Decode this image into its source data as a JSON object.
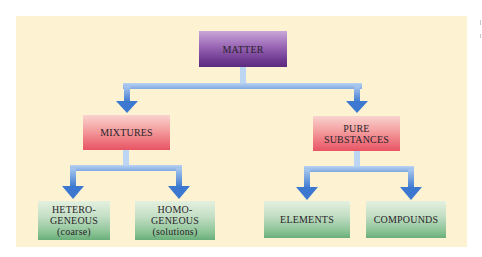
{
  "diagram": {
    "type": "hierarchy",
    "colors": {
      "background_panel": "#fdf3d2",
      "root_node": "#7a4a9c",
      "mid_nodes": "#ec6d78",
      "leaf_nodes": "#8dc497",
      "arrows": "#4a86d6"
    },
    "root": {
      "label": "MATTER"
    },
    "mixtures": {
      "label": "MIXTURES"
    },
    "pure_substances": {
      "line1": "PURE",
      "line2": "SUBSTANCES"
    },
    "heterogeneous": {
      "line1": "HETERO-",
      "line2": "GENEOUS",
      "line3": "(coarse)"
    },
    "homogeneous": {
      "line1": "HOMO-",
      "line2": "GENEOUS",
      "line3": "(solutions)"
    },
    "elements": {
      "label": "ELEMENTS"
    },
    "compounds": {
      "label": "COMPOUNDS"
    },
    "edges": [
      {
        "from": "MATTER",
        "to": "MIXTURES"
      },
      {
        "from": "MATTER",
        "to": "PURE SUBSTANCES"
      },
      {
        "from": "MIXTURES",
        "to": "HETEROGENEOUS (coarse)"
      },
      {
        "from": "MIXTURES",
        "to": "HOMOGENEOUS (solutions)"
      },
      {
        "from": "PURE SUBSTANCES",
        "to": "ELEMENTS"
      },
      {
        "from": "PURE SUBSTANCES",
        "to": "COMPOUNDS"
      }
    ]
  }
}
